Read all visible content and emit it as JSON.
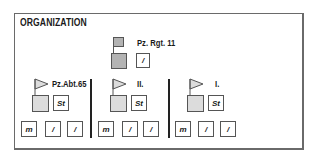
{
  "title": "ORGANIZATION",
  "colors": {
    "border": "#555555",
    "fill_dark": "#b3b3b3",
    "fill_light": "#dcdcdc",
    "divider": "#222222"
  },
  "regiment": {
    "label": "Pz. Rgt. 11",
    "staff_label": "/"
  },
  "battalions": [
    {
      "label": "Pz.Abt.65",
      "staff_label": "St",
      "companies": [
        "m",
        "/",
        "/"
      ]
    },
    {
      "label": "II.",
      "staff_label": "St",
      "companies": [
        "m",
        "/",
        "/"
      ]
    },
    {
      "label": "I.",
      "staff_label": "St",
      "companies": [
        "m",
        "/",
        "/"
      ]
    }
  ]
}
